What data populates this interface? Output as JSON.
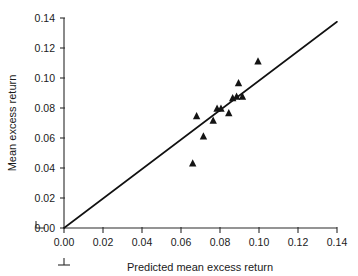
{
  "chart_data": {
    "type": "scatter",
    "title": "",
    "subtitle": "",
    "xlabel": "Predicted mean excess return",
    "ylabel": "Mean excess return",
    "xlim": [
      0.0,
      0.14
    ],
    "ylim": [
      0.0,
      0.14
    ],
    "xticks": [
      "0.00",
      "0.02",
      "0.04",
      "0.06",
      "0.08",
      "0.10",
      "0.12",
      "0.14"
    ],
    "xtick_values": [
      0.0,
      0.02,
      0.04,
      0.06,
      0.08,
      0.1,
      0.12,
      0.14
    ],
    "yticks": [
      "0.00",
      "0.02",
      "0.04",
      "0.06",
      "0.08",
      "0.10",
      "0.12",
      "0.14"
    ],
    "ytick_values": [
      0.0,
      0.02,
      0.04,
      0.06,
      0.08,
      0.1,
      0.12,
      0.14
    ],
    "grid": false,
    "legend": null,
    "legend_position": "none",
    "marker_shape": "triangle-up",
    "marker_color": "#141414",
    "series": [
      {
        "name": "portfolios",
        "marker": "triangle-up",
        "points": [
          {
            "x": 0.066,
            "y": 0.043
          },
          {
            "x": 0.068,
            "y": 0.0745
          },
          {
            "x": 0.0715,
            "y": 0.061
          },
          {
            "x": 0.0765,
            "y": 0.0715
          },
          {
            "x": 0.0785,
            "y": 0.0795
          },
          {
            "x": 0.0805,
            "y": 0.0795
          },
          {
            "x": 0.0845,
            "y": 0.0765
          },
          {
            "x": 0.0865,
            "y": 0.0865
          },
          {
            "x": 0.0885,
            "y": 0.0875
          },
          {
            "x": 0.0895,
            "y": 0.0965
          },
          {
            "x": 0.0915,
            "y": 0.0875
          },
          {
            "x": 0.0995,
            "y": 0.111
          }
        ]
      }
    ],
    "reference_line": {
      "name": "45-degree identity line",
      "from": {
        "x": 0.0,
        "y": 0.0
      },
      "to": {
        "x": 0.14,
        "y": 0.1375
      },
      "color": "#111111"
    },
    "axis_break_marks": [
      {
        "axis": "y",
        "at": 0.0,
        "note": "break tick left of y-axis origin"
      },
      {
        "axis": "x",
        "at": 0.0,
        "note": "break tick below x-axis origin"
      }
    ]
  }
}
